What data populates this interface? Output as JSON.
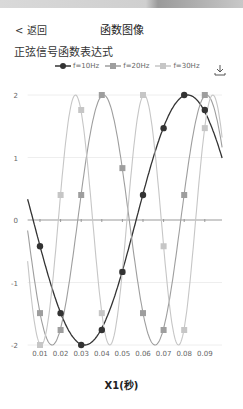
{
  "nav": {
    "back_label": "< 返回",
    "title": "函数图像"
  },
  "subtitle": "正弦信号函数表达式",
  "icons": {
    "download": "download-icon"
  },
  "colors": {
    "f10": "#333333",
    "f20": "#9e9e9e",
    "f30": "#c6c6c6",
    "grid": "#eeeeee",
    "axis": "#999999"
  },
  "chart_data": {
    "type": "line",
    "title": "正弦信号函数表达式",
    "xlabel": "X1(秒)",
    "ylabel": "",
    "x": [
      0.01,
      0.02,
      0.03,
      0.04,
      0.05,
      0.06,
      0.07,
      0.08,
      0.09
    ],
    "xlim": [
      0.004,
      0.098
    ],
    "ylim": [
      -2,
      2
    ],
    "yticks": [
      2,
      1,
      0,
      -1,
      -2
    ],
    "xticks": [
      "0.01",
      "0.02",
      "0.03",
      "0.04",
      "0.05",
      "0.06",
      "0.07",
      "0.08",
      "0.09"
    ],
    "grid": true,
    "legend_position": "top",
    "series": [
      {
        "name": "f=10Hz",
        "marker": "circle",
        "values": [
          -0.42,
          -1.49,
          -2.0,
          -1.76,
          -0.83,
          0.4,
          1.47,
          2.0,
          1.76
        ]
      },
      {
        "name": "f=20Hz",
        "marker": "square",
        "values": [
          -1.49,
          -1.76,
          0.4,
          2.0,
          0.83,
          -1.49,
          -1.76,
          0.4,
          2.0
        ]
      },
      {
        "name": "f=30Hz",
        "marker": "square",
        "values": [
          -2.0,
          0.4,
          1.76,
          -1.49,
          -0.83,
          2.0,
          -0.42,
          -1.76,
          1.47
        ]
      }
    ]
  }
}
